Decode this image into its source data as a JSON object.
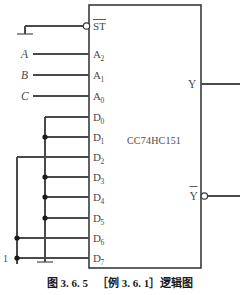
{
  "figure": {
    "chip_name": "CC74HC151",
    "caption_number": "图 3. 6. 5",
    "caption_text": "［例 3. 6. 1］逻辑图"
  },
  "control_pin": {
    "label": "ST",
    "overline": true,
    "bubble": true,
    "tied_to": "ground"
  },
  "select_inputs": [
    {
      "signal": "A",
      "pin": "A",
      "subscript": "2"
    },
    {
      "signal": "B",
      "pin": "A",
      "subscript": "1"
    },
    {
      "signal": "C",
      "pin": "A",
      "subscript": "0"
    }
  ],
  "data_inputs": [
    {
      "pin": "D",
      "subscript": "0",
      "tied_to": "ground",
      "junction_dot": false
    },
    {
      "pin": "D",
      "subscript": "1",
      "tied_to": "ground",
      "junction_dot": true
    },
    {
      "pin": "D",
      "subscript": "2",
      "tied_to": "one",
      "junction_dot": false
    },
    {
      "pin": "D",
      "subscript": "3",
      "tied_to": "ground",
      "junction_dot": true
    },
    {
      "pin": "D",
      "subscript": "4",
      "tied_to": "ground",
      "junction_dot": true
    },
    {
      "pin": "D",
      "subscript": "5",
      "tied_to": "ground",
      "junction_dot": true
    },
    {
      "pin": "D",
      "subscript": "6",
      "tied_to": "one",
      "junction_dot": true
    },
    {
      "pin": "D",
      "subscript": "7",
      "tied_to": "one",
      "junction_dot": true
    }
  ],
  "outputs": [
    {
      "label": "Y",
      "overline": false,
      "bubble": false
    },
    {
      "label": "Y",
      "overline": true,
      "bubble": true
    }
  ],
  "constants": {
    "logic_one_label": "1"
  },
  "colors": {
    "wire": "#4a4a4a",
    "box": "#3a3a3a",
    "dot": "#1a1a1a",
    "text": "#4a4a4a",
    "caption": "#1a1a1a",
    "background": "#ffffff"
  }
}
